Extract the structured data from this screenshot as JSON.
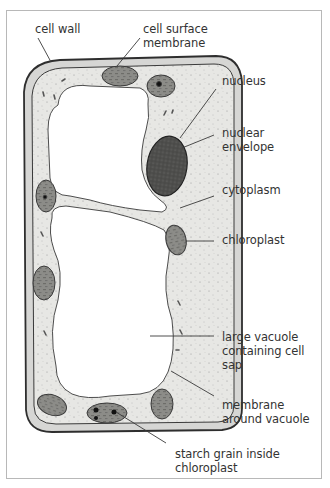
{
  "diagram": {
    "colors": {
      "cell_wall": "#d8d8d8",
      "cytoplasm": "#e6e6e3",
      "vacuole": "#ffffff",
      "chloroplast": "#8a8a86",
      "nucleus": "#4a4a48",
      "outline": "#2e2e2e",
      "leader_line": "#3a3a3a",
      "label_text": "#333333"
    },
    "labels": {
      "cell_wall": "cell wall",
      "cell_surface_membrane": "cell surface\nmembrane",
      "nucleus": "nucleus",
      "nuclear_envelope": "nuclear\nenvelope",
      "cytoplasm": "cytoplasm",
      "chloroplast": "chloroplast",
      "large_vacuole": "large vacuole\ncontaining cell\nsap",
      "membrane_around_vacuole": "membrane\naround vacuole",
      "starch_grain": "starch grain inside\nchloroplast"
    }
  }
}
